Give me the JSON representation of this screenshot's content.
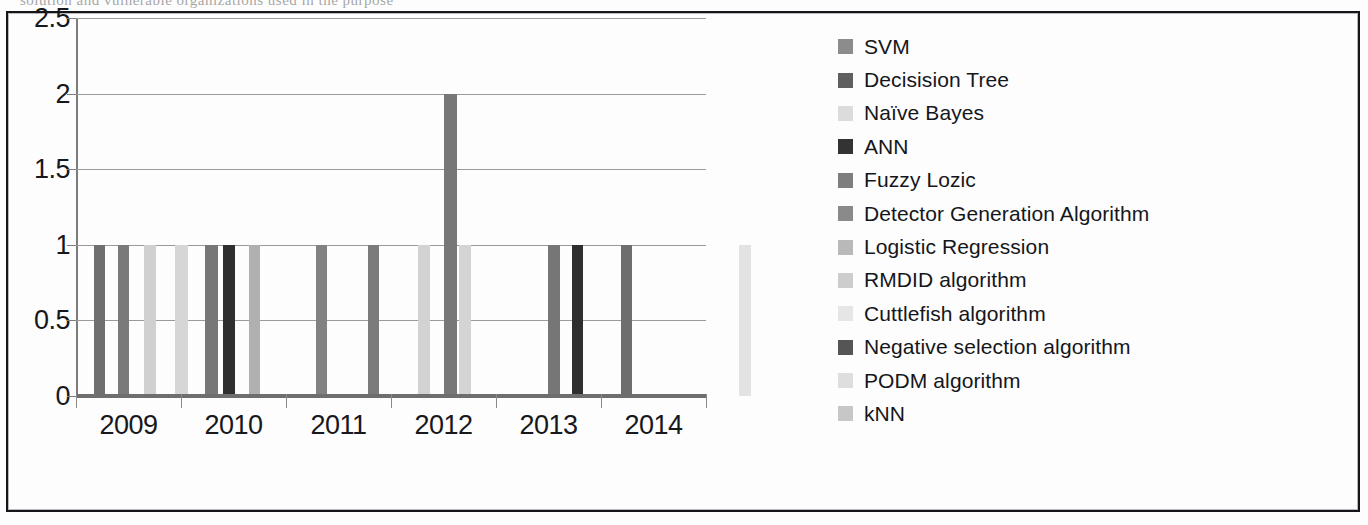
{
  "document": {
    "cutoff_top_text": "solution and vulnerable organizations used in the purpose"
  },
  "chart_data": {
    "type": "bar",
    "title": "",
    "xlabel": "",
    "ylabel": "",
    "ylim": [
      0,
      2.5
    ],
    "ytick_labels": [
      "0",
      "0.5",
      "1",
      "1.5",
      "2",
      "2.5"
    ],
    "ytick_values": [
      0,
      0.5,
      1,
      1.5,
      2,
      2.5
    ],
    "categories": [
      "2009",
      "2010",
      "2011",
      "2012",
      "2013",
      "2014"
    ],
    "grid": true,
    "legend_position": "right",
    "series": [
      {
        "name": "SVM",
        "color": "#8c8c8c"
      },
      {
        "name": "Decisision Tree",
        "color": "#6b6b6b"
      },
      {
        "name": "Naïve Bayes",
        "color": "#dcdcdc"
      },
      {
        "name": "ANN",
        "color": "#3a3a3a"
      },
      {
        "name": "Fuzzy Lozic",
        "color": "#7e7e7e"
      },
      {
        "name": "Detector Generation Algorithm",
        "color": "#8a8a8a"
      },
      {
        "name": "Logistic Regression",
        "color": "#b9b9b9"
      },
      {
        "name": "RMDID algorithm",
        "color": "#cfcfcf"
      },
      {
        "name": "Cuttlefish algorithm",
        "color": "#e8e8e8"
      },
      {
        "name": "Negative selection algorithm",
        "color": "#5c5c5c"
      },
      {
        "name": "PODM algorithm",
        "color": "#dedede"
      },
      {
        "name": "kNN",
        "color": "#cacaca"
      }
    ],
    "bars": [
      {
        "series": "SVM",
        "category": "2009",
        "value": 1,
        "x": 18,
        "width": 11,
        "color": "#6f6f6f"
      },
      {
        "series": "Decisision Tree",
        "category": "2009",
        "value": 1,
        "x": 42,
        "width": 11,
        "color": "#7a7a7a"
      },
      {
        "series": "Naïve Bayes",
        "category": "2009",
        "value": 1,
        "x": 68,
        "width": 12,
        "color": "#d0d0d0"
      },
      {
        "series": "Fuzzy Lozic",
        "category": "2009",
        "value": 1,
        "x": 99,
        "width": 13,
        "color": "#d6d6d6"
      },
      {
        "series": "Fuzzy Lozic",
        "category": "2010",
        "value": 1,
        "x": 129,
        "width": 13,
        "color": "#777777"
      },
      {
        "series": "ANN",
        "category": "2010",
        "value": 1,
        "x": 147,
        "width": 12,
        "color": "#2f2f2f"
      },
      {
        "series": "Logistic Regression",
        "category": "2010",
        "value": 1,
        "x": 173,
        "width": 11,
        "color": "#b0b0b0"
      },
      {
        "series": "Fuzzy Lozic",
        "category": "2011",
        "value": 1,
        "x": 240,
        "width": 11,
        "color": "#828282"
      },
      {
        "series": "Detector Generation Algorithm",
        "category": "2011",
        "value": 1,
        "x": 292,
        "width": 11,
        "color": "#7b7b7b"
      },
      {
        "series": "RMDID algorithm",
        "category": "2011",
        "value": 1,
        "x": 342,
        "width": 12,
        "color": "#d2d2d2"
      },
      {
        "series": "Cuttlefish algorithm",
        "category": "2012",
        "value": 2,
        "x": 368,
        "width": 13,
        "color": "#777777"
      },
      {
        "series": "Negative selection algorithm",
        "category": "2012",
        "value": 1,
        "x": 383,
        "width": 12,
        "color": "#d4d4d4"
      },
      {
        "series": "Negative selection algorithm",
        "category": "2013",
        "value": 1,
        "x": 472,
        "width": 12,
        "color": "#767676"
      },
      {
        "series": "ANN",
        "category": "2013",
        "value": 1,
        "x": 496,
        "width": 11,
        "color": "#2e2e2e"
      },
      {
        "series": "Detector Generation Algorithm",
        "category": "2013",
        "value": 1,
        "x": 545,
        "width": 11,
        "color": "#6e6e6e"
      },
      {
        "series": "kNN",
        "category": "2014",
        "value": 1,
        "x": 663,
        "width": 12,
        "color": "#e3e3e3"
      }
    ]
  },
  "legend": {
    "items": [
      {
        "label": "SVM",
        "color": "#8c8c8c"
      },
      {
        "label": "Decisision Tree",
        "color": "#5f5f5f"
      },
      {
        "label": "Naïve Bayes",
        "color": "#dcdcdc"
      },
      {
        "label": "ANN",
        "color": "#333333"
      },
      {
        "label": "Fuzzy Lozic",
        "color": "#7e7e7e"
      },
      {
        "label": "Detector Generation Algorithm",
        "color": "#8a8a8a"
      },
      {
        "label": "Logistic Regression",
        "color": "#b9b9b9"
      },
      {
        "label": "RMDID algorithm",
        "color": "#cdcdcd"
      },
      {
        "label": "Cuttlefish algorithm",
        "color": "#e6e6e6"
      },
      {
        "label": "Negative selection algorithm",
        "color": "#555555"
      },
      {
        "label": "PODM algorithm",
        "color": "#dedede"
      },
      {
        "label": "kNN",
        "color": "#c7c7c7"
      }
    ]
  }
}
